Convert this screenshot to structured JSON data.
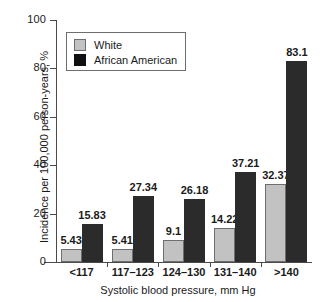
{
  "chart_data": {
    "type": "bar",
    "title": "",
    "subtitle": "",
    "xlabel": "Systolic blood pressure, mm Hg",
    "ylabel": "Incidence per 100,000 person-years, %",
    "categories": [
      "<117",
      "117–123",
      "124–130",
      "131–140",
      ">140"
    ],
    "series": [
      {
        "name": "White",
        "color": "#c2c2c2",
        "values": [
          5.43,
          5.41,
          9.1,
          14.22,
          32.37
        ],
        "labels": [
          "5.43",
          "5.41",
          "9.1",
          "14.22",
          "32.37"
        ]
      },
      {
        "name": "African American",
        "color": "#101010",
        "values": [
          15.83,
          27.34,
          26.18,
          37.21,
          83.1
        ],
        "labels": [
          "15.83",
          "27.34",
          "26.18",
          "37.21",
          "83.1"
        ]
      }
    ],
    "ylim": [
      0,
      100
    ],
    "yticks": [
      0,
      20,
      40,
      60,
      80,
      100
    ],
    "ytick_labels": [
      "0",
      "20",
      "40",
      "60",
      "80",
      "100"
    ],
    "grid": false,
    "legend_position": "upper-left",
    "legend_entries": [
      "White",
      "African American"
    ]
  }
}
